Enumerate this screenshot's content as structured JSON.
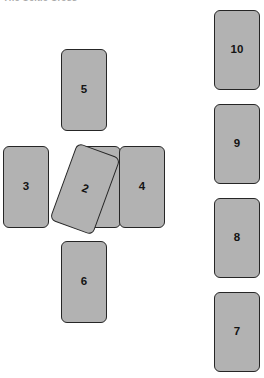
{
  "diagram": {
    "caption": "The Celtic Cross",
    "colors": {
      "card_fill": "#b2b2b2",
      "card_border": "#262626",
      "label_text": "#141414",
      "background": "#ffffff"
    },
    "cards": [
      {
        "id": "card-1",
        "number": "1",
        "group": "cross",
        "label_position": "top-right",
        "rotation_deg": 0
      },
      {
        "id": "card-2",
        "number": "2",
        "group": "cross",
        "label_position": "center",
        "rotation_deg": 20
      },
      {
        "id": "card-3",
        "number": "3",
        "group": "cross",
        "label_position": "center",
        "rotation_deg": 0
      },
      {
        "id": "card-4",
        "number": "4",
        "group": "cross",
        "label_position": "center",
        "rotation_deg": 0
      },
      {
        "id": "card-5",
        "number": "5",
        "group": "cross",
        "label_position": "center",
        "rotation_deg": 0
      },
      {
        "id": "card-6",
        "number": "6",
        "group": "cross",
        "label_position": "center",
        "rotation_deg": 0
      },
      {
        "id": "card-7",
        "number": "7",
        "group": "staff",
        "label_position": "center",
        "rotation_deg": 0
      },
      {
        "id": "card-8",
        "number": "8",
        "group": "staff",
        "label_position": "center",
        "rotation_deg": 0
      },
      {
        "id": "card-9",
        "number": "9",
        "group": "staff",
        "label_position": "center",
        "rotation_deg": 0
      },
      {
        "id": "card-10",
        "number": "10",
        "group": "staff",
        "label_position": "center",
        "rotation_deg": 0
      }
    ]
  }
}
